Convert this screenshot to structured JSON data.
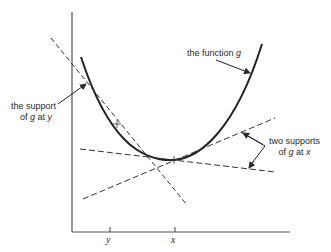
{
  "diagram": {
    "labels": {
      "function": {
        "prefix": "the function ",
        "var": "g"
      },
      "support_y": {
        "line1": "the support",
        "line2_prefix": "of ",
        "line2_var": "g",
        "line2_mid": " at ",
        "line2_var2": "y"
      },
      "supports_x": {
        "line1": "two supports",
        "line2_prefix": "of ",
        "line2_var": "g",
        "line2_mid": " at ",
        "line2_var2": "x"
      }
    },
    "ticks": {
      "y": "y",
      "x": "x"
    },
    "colors": {
      "ink": "#2a2a2a",
      "background": "#ffffff"
    }
  }
}
